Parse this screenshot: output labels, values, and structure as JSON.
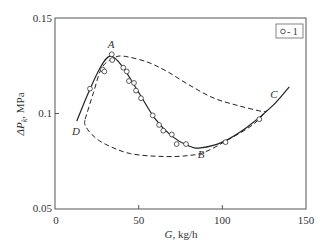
{
  "chart_data": {
    "type": "line",
    "title": "",
    "xlabel": "G, kg/h",
    "ylabel": "ΔP_k, MPa",
    "xlim": [
      0,
      150
    ],
    "ylim": [
      0.05,
      0.15
    ],
    "x_ticks": [
      "0",
      "50",
      "100",
      "150"
    ],
    "y_ticks": [
      "0.05",
      "0.1",
      "0.15"
    ],
    "grid": false,
    "legend": {
      "position": "top-right",
      "entries": [
        "o - 1"
      ]
    },
    "annotations": [
      {
        "label": "A",
        "x": 33,
        "y": 0.1355
      },
      {
        "label": "B",
        "x": 87,
        "y": 0.0795
      },
      {
        "label": "C",
        "x": 126,
        "y": 0.1085
      },
      {
        "label": "D",
        "x": 13,
        "y": 0.0935
      }
    ],
    "series": [
      {
        "name": "1 (experimental)",
        "style": "markers-circle",
        "x": [
          20.9,
          28.5,
          29.5,
          33.9,
          34.2,
          40.8,
          42.9,
          44.2,
          47.2,
          48.4,
          51.4,
          58.4,
          62.2,
          64.7,
          69.8,
          72.7,
          78.3,
          101.9,
          122.1
        ],
        "y": [
          0.113,
          0.123,
          0.122,
          0.131,
          0.128,
          0.124,
          0.122,
          0.117,
          0.116,
          0.112,
          0.108,
          0.099,
          0.094,
          0.091,
          0.089,
          0.084,
          0.084,
          0.085,
          0.097
        ]
      },
      {
        "name": "static characteristic",
        "style": "solid",
        "x": [
          13,
          20,
          27,
          33,
          40,
          50,
          60,
          70,
          80,
          87,
          100,
          115,
          130,
          140
        ],
        "y": [
          0.096,
          0.111,
          0.124,
          0.13,
          0.125,
          0.111,
          0.097,
          0.088,
          0.083,
          0.082,
          0.085,
          0.093,
          0.104,
          0.114
        ]
      },
      {
        "name": "hysteresis loop D-A-C-B-D",
        "style": "dashed",
        "x": [
          18,
          23,
          28,
          35,
          41,
          55,
          67,
          80,
          95,
          110,
          124,
          126,
          118,
          105,
          90,
          80,
          65,
          45,
          30,
          22,
          18,
          18
        ],
        "y": [
          0.097,
          0.111,
          0.124,
          0.129,
          0.13,
          0.127,
          0.122,
          0.115,
          0.108,
          0.104,
          0.101,
          0.101,
          0.094,
          0.087,
          0.08,
          0.078,
          0.0775,
          0.079,
          0.084,
          0.089,
          0.094,
          0.097
        ]
      }
    ]
  },
  "axes": {
    "x_title_italic": "G",
    "x_title_rest": ", kg/h",
    "y_title_prefix": "ΔP",
    "y_title_sub": "k",
    "y_title_rest": ", MPa",
    "x_ticks": [
      "0",
      "50",
      "100",
      "150"
    ],
    "y_ticks": [
      "0.05",
      "0.1",
      "0.15"
    ]
  },
  "legend": {
    "marker": "o",
    "text": "- 1"
  },
  "labels": {
    "A": "A",
    "B": "B",
    "C": "C",
    "D": "D"
  }
}
